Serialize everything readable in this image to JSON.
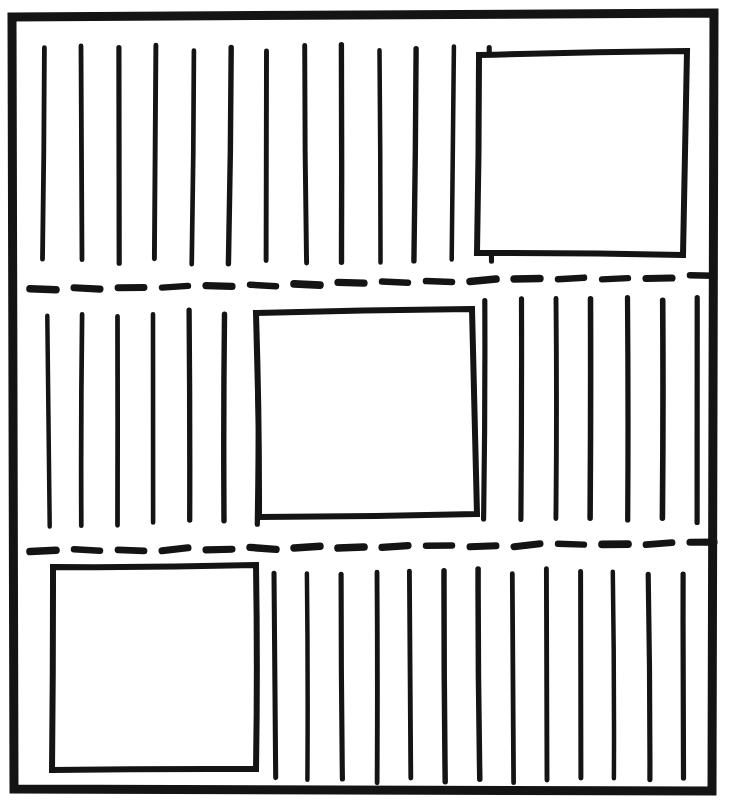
{
  "figure": {
    "kind": "hand-drawn-page-layout-sketch",
    "canvas": {
      "width": 732,
      "height": 811,
      "background": "#ffffff"
    },
    "ink_color": "#141414"
  },
  "page_border": {
    "label": "page-border",
    "stroke_width": 9,
    "corners": {
      "top_left": [
        12,
        17
      ],
      "top_right": [
        714,
        13
      ],
      "bottom_right": [
        712,
        791
      ],
      "bottom_left": [
        14,
        789
      ]
    }
  },
  "dashed_rules": [
    {
      "label": "dashed-rule-upper",
      "stroke_width": 7,
      "dash_length": 26,
      "dash_gap": 18,
      "x_start": 30,
      "x_end": 714,
      "y_start": 290,
      "y_end": 276
    },
    {
      "label": "dashed-rule-lower",
      "stroke_width": 7,
      "dash_length": 26,
      "dash_gap": 18,
      "x_start": 30,
      "x_end": 714,
      "y_start": 551,
      "y_end": 543
    }
  ],
  "image_boxes": [
    {
      "label": "image-box-top-right",
      "stroke_width": 6,
      "corners": {
        "tl": [
          479,
          55
        ],
        "tr": [
          687,
          51
        ],
        "br": [
          683,
          255
        ],
        "bl": [
          477,
          253
        ]
      }
    },
    {
      "label": "image-box-middle-center",
      "stroke_width": 6,
      "corners": {
        "tl": [
          256,
          313
        ],
        "tr": [
          472,
          309
        ],
        "br": [
          477,
          514
        ],
        "bl": [
          259,
          517
        ]
      }
    },
    {
      "label": "image-box-bottom-left",
      "stroke_width": 6,
      "corners": {
        "tl": [
          53,
          567
        ],
        "tr": [
          256,
          565
        ],
        "br": [
          256,
          769
        ],
        "bl": [
          52,
          770
        ]
      }
    }
  ],
  "text_stroke_bands": [
    {
      "label": "band-top-text-strokes",
      "stroke_width": 5,
      "count": 13,
      "x_first": 44,
      "x_step": 37.2,
      "y_top": 48,
      "y_bottom": 262,
      "note": "Full width column of strokes left of the top-right image box."
    },
    {
      "label": "band-middle-left-text-strokes",
      "stroke_width": 5,
      "count": 7,
      "x_first": 48,
      "x_step": 35.2,
      "y_top": 313,
      "y_bottom": 523,
      "note": "Strokes in the narrow column left of the centre image box."
    },
    {
      "label": "band-middle-right-text-strokes",
      "stroke_width": 5,
      "count": 7,
      "x_first": 485,
      "x_step": 35.5,
      "y_top": 300,
      "y_bottom": 520,
      "note": "Strokes in the column right of the centre image box."
    },
    {
      "label": "band-bottom-text-strokes",
      "stroke_width": 5,
      "count": 13,
      "x_first": 274,
      "x_step": 34.0,
      "y_top": 572,
      "y_bottom": 780,
      "note": "Strokes filling the area right of the bottom-left image box."
    }
  ],
  "legend": {
    "vertical_stroke_meaning": "line of body text",
    "rectangle_meaning": "image / figure placeholder",
    "dashed_rule_meaning": "band separator"
  }
}
